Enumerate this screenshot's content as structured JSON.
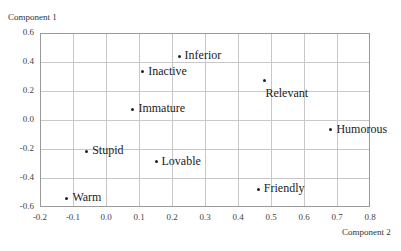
{
  "chart_data": {
    "type": "scatter",
    "title": "",
    "xlabel": "Component 2",
    "ylabel": "Component 1",
    "xlim": [
      -0.2,
      0.8
    ],
    "ylim": [
      -0.6,
      0.6
    ],
    "grid": true,
    "x_ticks": [
      "-0.2",
      "-0.1",
      "0.0",
      "0.1",
      "0.2",
      "0.3",
      "0.4",
      "0.5",
      "0.6",
      "0.7",
      "0.8"
    ],
    "y_ticks": [
      "0.6",
      "0.4",
      "0.2",
      "0.0",
      "-0.2",
      "-0.4",
      "-0.6"
    ],
    "points": [
      {
        "label": "Inferior",
        "x": 0.22,
        "y": 0.45
      },
      {
        "label": "Inactive",
        "x": 0.11,
        "y": 0.34
      },
      {
        "label": "Immature",
        "x": 0.08,
        "y": 0.08
      },
      {
        "label": "Relevant",
        "x": 0.48,
        "y": 0.2
      },
      {
        "label": "Humorous",
        "x": 0.68,
        "y": -0.06
      },
      {
        "label": "Stupid",
        "x": -0.06,
        "y": -0.21
      },
      {
        "label": "Lovable",
        "x": 0.15,
        "y": -0.28
      },
      {
        "label": "Friendly",
        "x": 0.46,
        "y": -0.47
      },
      {
        "label": "Warm",
        "x": -0.12,
        "y": -0.53
      }
    ]
  }
}
